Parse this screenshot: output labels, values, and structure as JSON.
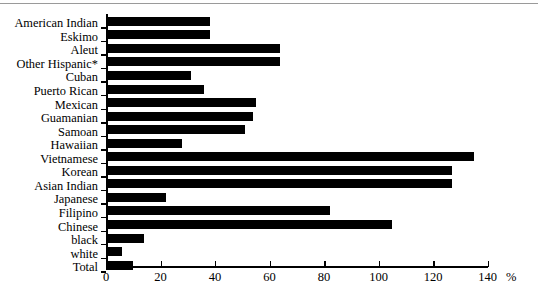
{
  "chart_data": {
    "type": "bar",
    "orientation": "horizontal",
    "title": "",
    "xlabel": "%",
    "ylabel": "",
    "xlim": [
      0,
      140
    ],
    "xticks": [
      0,
      20,
      40,
      60,
      80,
      100,
      120,
      140
    ],
    "grid": false,
    "legend": null,
    "footnote": "* Other Hispanic",
    "categories": [
      "American Indian",
      "Eskimo",
      "Aleut",
      "Other Hispanic*",
      "Cuban",
      "Puerto Rican",
      "Mexican",
      "Guamanian",
      "Samoan",
      "Hawaiian",
      "Vietnamese",
      "Korean",
      "Asian Indian",
      "Japanese",
      "Filipino",
      "Chinese",
      "black",
      "white",
      "Total"
    ],
    "values": [
      38,
      38,
      64,
      64,
      31,
      36,
      55,
      54,
      51,
      28,
      135,
      127,
      127,
      22,
      82,
      105,
      14,
      6,
      10
    ]
  }
}
